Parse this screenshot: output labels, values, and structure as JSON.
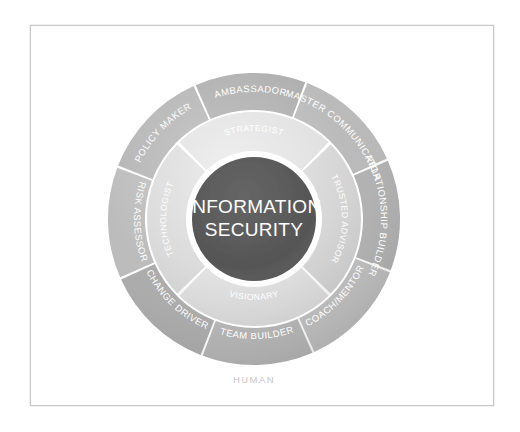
{
  "diagram": {
    "title_line1": "INFORMATION",
    "title_line2": "SECURITY",
    "caption": "HUMAN",
    "center_color": "#555555",
    "inner_ring_color": "#d9d9d9",
    "outer_ring_color": "#b4b4b4",
    "label_color": "#ffffff",
    "caption_color": "#c6c6c6",
    "frame_border_color": "#c9c9c9",
    "background_color": "#ffffff",
    "outer_segments": [
      {
        "label": "AMBASSADOR",
        "tone": "#a9a9a9"
      },
      {
        "label": "MASTER COMMUNICATOR",
        "tone": "#b6b6b6"
      },
      {
        "label": "RELATIONSHIP BUILDER",
        "tone": "#aeaeae"
      },
      {
        "label": "COACH/MENTOR",
        "tone": "#bcbcbc"
      },
      {
        "label": "TEAM BUILDER",
        "tone": "#b2b2b2"
      },
      {
        "label": "CHANGE DRIVER",
        "tone": "#a7a7a7"
      },
      {
        "label": "RISK ASSESSOR",
        "tone": "#b8b8b8"
      },
      {
        "label": "POLICY MAKER",
        "tone": "#b0b0b0"
      }
    ],
    "inner_segments": [
      {
        "label": "STRATEGIST",
        "tone": "#dcdcdc"
      },
      {
        "label": "TRUSTED ADVISOR",
        "tone": "#d2d2d2"
      },
      {
        "label": "VISIONARY",
        "tone": "#dedede"
      },
      {
        "label": "TECHNOLOGIST",
        "tone": "#d6d6d6"
      }
    ],
    "geometry": {
      "center_x": 254,
      "center_y": 219,
      "outer_radius": 146,
      "outer_inner_radius": 109,
      "mid_radius": 107,
      "mid_inner_radius": 68,
      "core_radius": 62
    }
  }
}
